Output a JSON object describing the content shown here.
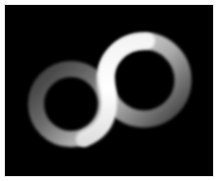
{
  "image": {
    "description": "Glowing grey-white infinity / figure-eight torus shape on black background",
    "alt": "Infinity symbol made of two glowing rings",
    "background_color": "#000000",
    "border_color": "#ffffff",
    "ring_color_dim": "#5a5a5a",
    "ring_color_bright": "#f2f2f2"
  }
}
